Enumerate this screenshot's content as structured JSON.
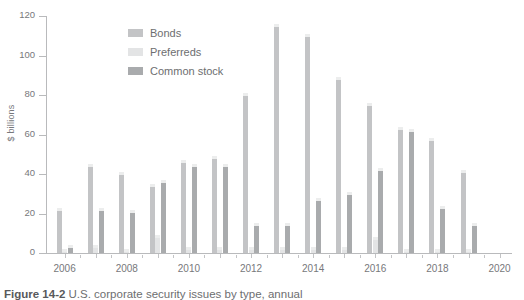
{
  "figure": {
    "ylabel": "$ billions",
    "caption_prefix": "Figure 14-2",
    "caption_text": "U.S. corporate security issues by type, annual"
  },
  "legend": {
    "position": "inside-top-left",
    "items": [
      {
        "label": "Bonds",
        "color": "#c3c4c6",
        "key": "bonds"
      },
      {
        "label": "Preferreds",
        "color": "#e3e4e5",
        "key": "preferreds"
      },
      {
        "label": "Common stock",
        "color": "#a9abad",
        "key": "common"
      }
    ]
  },
  "chart_data": {
    "type": "bar",
    "title": "",
    "subtitle": "",
    "xlabel": "",
    "ylabel": "$ billions",
    "ylim": [
      0,
      120
    ],
    "yticks": [
      0,
      20,
      40,
      60,
      80,
      100,
      120
    ],
    "ytick_labels": [
      "0",
      "20",
      "40",
      "60",
      "80",
      "100",
      "120"
    ],
    "xlim": [
      2005.4,
      2020.4
    ],
    "xticks": [
      2006,
      2008,
      2010,
      2012,
      2014,
      2016,
      2018,
      2020
    ],
    "xtick_labels": [
      "2006",
      "2008",
      "2010",
      "2012",
      "2014",
      "2016",
      "2018",
      "2020"
    ],
    "grid": false,
    "legend_position": "upper center-left",
    "categories": [
      2006,
      2007,
      2008,
      2009,
      2010,
      2011,
      2012,
      2013,
      2014,
      2015,
      2016,
      2017,
      2018,
      2019
    ],
    "series": [
      {
        "name": "Bonds",
        "color": "#c3c4c6",
        "values": [
          23,
          45,
          41,
          35,
          47,
          49,
          81,
          116,
          111,
          89,
          76,
          64,
          58,
          42
        ]
      },
      {
        "name": "Preferreds",
        "color": "#e3e4e5",
        "values": [
          2,
          4,
          2,
          9,
          3,
          3,
          3,
          3,
          3,
          3,
          8,
          2,
          2,
          2
        ]
      },
      {
        "name": "Common stock",
        "color": "#a9abad",
        "values": [
          4,
          23,
          22,
          37,
          45,
          45,
          15,
          15,
          28,
          31,
          43,
          63,
          24,
          15
        ]
      }
    ]
  }
}
